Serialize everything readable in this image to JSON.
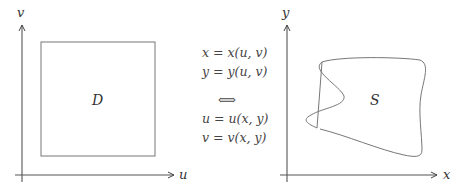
{
  "left_plot": {
    "vertical_axis_label": "v",
    "horizontal_axis_label": "u",
    "region_label": "D",
    "region_shape": "square"
  },
  "middle": {
    "equations": [
      {
        "lhs": "x",
        "eq": " = ",
        "fn": "x",
        "args": "(u, v)"
      },
      {
        "lhs": "y",
        "eq": " = ",
        "fn": "y",
        "args": "(u, v)"
      },
      {
        "lhs": "u",
        "eq": " = ",
        "fn": "u",
        "args": "(x, y)"
      },
      {
        "lhs": "v",
        "eq": " = ",
        "fn": "v",
        "args": "(x, y)"
      }
    ],
    "equivalence_symbol": "⟺"
  },
  "right_plot": {
    "vertical_axis_label": "y",
    "horizontal_axis_label": "x",
    "region_label": "S",
    "region_shape": "irregular closed curve"
  },
  "colors": {
    "axis": "#555555",
    "region_outline": "#777777",
    "text": "#333333"
  }
}
